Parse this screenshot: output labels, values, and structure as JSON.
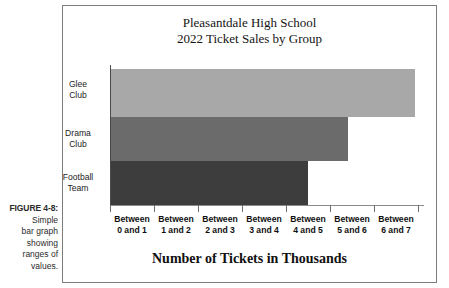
{
  "caption": {
    "figure_label": "FIGURE 4-8:",
    "lines": [
      "Simple",
      "bar graph",
      "showing",
      "ranges of",
      "values."
    ]
  },
  "chart_data": {
    "type": "bar",
    "orientation": "horizontal",
    "title": "Pleasantdale High School 2022 Ticket Sales by Group",
    "title_lines": [
      "Pleasantdale High School",
      "2022 Ticket Sales by Group"
    ],
    "xlabel": "Number of Tickets in Thousands",
    "ylabel": "",
    "categories": [
      "Glee Club",
      "Drama Club",
      "Football Team"
    ],
    "category_lines": [
      [
        "Glee",
        "Club"
      ],
      [
        "Drama",
        "Club"
      ],
      [
        "Football",
        "Team"
      ]
    ],
    "values": [
      6.8,
      5.3,
      4.4
    ],
    "value_ranges": [
      "Between 6 and 7",
      "Between 5 and 6",
      "Between 4 and 5"
    ],
    "bar_colors": [
      "#a8a8a8",
      "#6b6b6b",
      "#3d3d3d"
    ],
    "xlim": [
      0,
      7
    ],
    "xtick_labels": [
      [
        "Between",
        "0 and 1"
      ],
      [
        "Between",
        "1 and 2"
      ],
      [
        "Between",
        "2 and 3"
      ],
      [
        "Between",
        "3 and 4"
      ],
      [
        "Between",
        "4 and 5"
      ],
      [
        "Between",
        "5 and 6"
      ],
      [
        "Between",
        "6 and 7"
      ]
    ],
    "xtick_values": [
      0,
      1,
      2,
      3,
      4,
      5,
      6,
      7
    ],
    "grid": false,
    "legend": "none",
    "axis_color": "#4a4a4a",
    "frame_color": "#7c7c7c"
  }
}
